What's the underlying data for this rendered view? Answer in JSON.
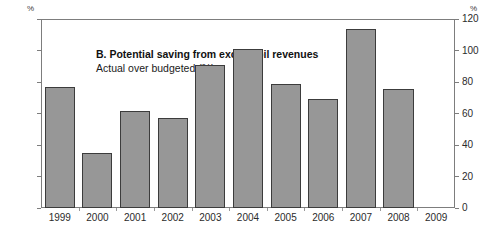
{
  "chart_data": {
    "type": "bar",
    "title": "B. Potential saving from excess oil revenues",
    "subtitle": "Actual over budgeted (%)",
    "xlabel": "",
    "ylabel": "%",
    "y_unit_left": "%",
    "y_unit_right": "%",
    "ylim": [
      0,
      120
    ],
    "yticks": [
      0,
      20,
      40,
      60,
      80,
      100,
      120
    ],
    "ytick_labels_left": [
      "0",
      "20",
      "40",
      "60",
      "80",
      "100",
      "120"
    ],
    "ytick_labels_right": [
      "0",
      "20",
      "40",
      "60",
      "80",
      "100",
      "120"
    ],
    "grid": false,
    "legend": null,
    "categories": [
      "1999",
      "2000",
      "2001",
      "2002",
      "2003",
      "2004",
      "2005",
      "2006",
      "2007",
      "2008",
      "2009"
    ],
    "values": [
      77,
      35,
      61.5,
      57,
      91,
      101,
      78.5,
      69.5,
      113.5,
      75.5,
      null
    ],
    "bar_color": "#979797",
    "bar_edge_color": "#3c3c3c",
    "frame_color": "#7d7d7d",
    "background": "#ffffff"
  }
}
